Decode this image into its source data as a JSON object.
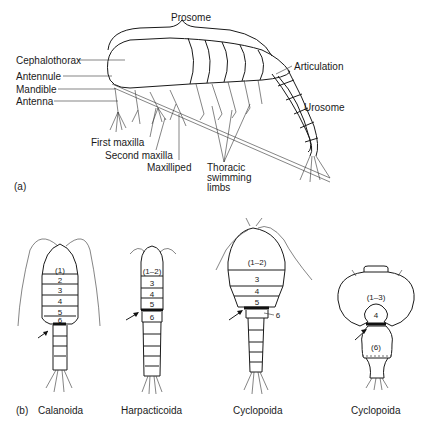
{
  "panel_a": {
    "tag": "(a)",
    "labels": {
      "prosome": "Prosome",
      "cephalothorax": "Cephalothorax",
      "antennule": "Antennule",
      "mandible": "Mandible",
      "antenna": "Antenna",
      "first_maxilla": "First maxilla",
      "second_maxilla": "Second maxilla",
      "maxilliped": "Maxilliped",
      "thoracic_swimming_limbs": "Thoracic swimming limbs",
      "thoracic_1": "Thoracic",
      "thoracic_2": "swimming",
      "thoracic_3": "limbs",
      "articulation": "Articulation",
      "urosome": "Urosome"
    }
  },
  "panel_b": {
    "tag": "(b)",
    "specimens": [
      {
        "name": "Calanoida",
        "segments": [
          "(1)",
          "2",
          "3",
          "4",
          "5",
          "6"
        ]
      },
      {
        "name": "Harpacticoida",
        "segments": [
          "(1–2)",
          "3",
          "4",
          "5",
          "6"
        ]
      },
      {
        "name": "Cyclopoida",
        "segments": [
          "(1–2)",
          "3",
          "4",
          "5",
          "6"
        ]
      },
      {
        "name": "Cyclopoida",
        "segments": [
          "(1–3)",
          "4",
          "(6)"
        ]
      }
    ]
  }
}
